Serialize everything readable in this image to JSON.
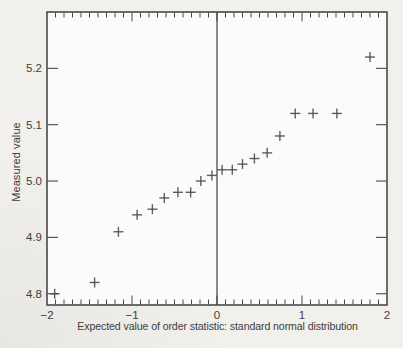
{
  "chart_data": {
    "type": "scatter",
    "marker_symbol": "+",
    "title": "",
    "xlabel": "Expected value of order statistic: standard normal distribution",
    "ylabel": "Measured value",
    "xlim": [
      -2,
      2
    ],
    "ylim": [
      4.78,
      5.3
    ],
    "x_ticks": [
      -2,
      -1,
      0,
      1,
      2
    ],
    "x_tick_labels": [
      "−2",
      "−1",
      "0",
      "1",
      "2"
    ],
    "x_minor_tick_step": 0.1,
    "y_ticks": [
      4.8,
      4.9,
      5.0,
      5.1,
      5.2
    ],
    "y_tick_labels": [
      "4.8",
      "4.9",
      "5.0",
      "5.1",
      "5.2"
    ],
    "reference_line_x": 0,
    "grid": false,
    "legend_position": "none",
    "points": [
      [
        -1.91,
        4.8
      ],
      [
        -1.44,
        4.82
      ],
      [
        -1.16,
        4.91
      ],
      [
        -0.94,
        4.94
      ],
      [
        -0.76,
        4.95
      ],
      [
        -0.62,
        4.97
      ],
      [
        -0.46,
        4.98
      ],
      [
        -0.31,
        4.98
      ],
      [
        -0.19,
        5.0
      ],
      [
        -0.06,
        5.01
      ],
      [
        0.06,
        5.02
      ],
      [
        0.18,
        5.02
      ],
      [
        0.3,
        5.03
      ],
      [
        0.44,
        5.04
      ],
      [
        0.59,
        5.05
      ],
      [
        0.74,
        5.08
      ],
      [
        0.92,
        5.12
      ],
      [
        1.13,
        5.12
      ],
      [
        1.41,
        5.12
      ],
      [
        1.8,
        5.22
      ]
    ]
  },
  "colors": {
    "paper": "#f1f0ec",
    "plot_background": "#fcfbf9",
    "axis_line": "#3e3e3e",
    "tick": "#4a4a4a",
    "marker": "#4e4e4e",
    "text": "#3d3d3d"
  }
}
